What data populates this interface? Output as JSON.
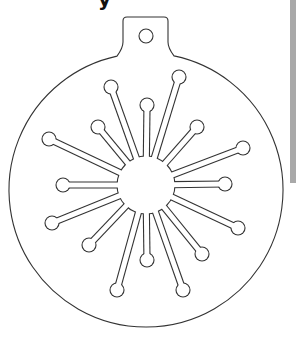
{
  "top_glyph": "y",
  "colors": {
    "line": "#333333",
    "background": "#ffffff",
    "side_strip": "#a9a9a9"
  },
  "ornament": {
    "outer_circle": {
      "cx": 146,
      "cy": 190,
      "r": 137
    },
    "hanger_tab": {
      "left": 123,
      "right": 168,
      "top": 17,
      "join_y": 46,
      "corner_r": 4
    },
    "hanger_hole": {
      "cx": 146,
      "cy": 36,
      "r": 7
    },
    "hub": {
      "cx": 146,
      "cy": 185,
      "r": 29
    },
    "stem_width": 5,
    "ball_r": 7,
    "spokes": [
      {
        "x": 111,
        "y": 87
      },
      {
        "x": 179,
        "y": 77
      },
      {
        "x": 147,
        "y": 105
      },
      {
        "x": 98,
        "y": 127
      },
      {
        "x": 197,
        "y": 127
      },
      {
        "x": 49,
        "y": 139
      },
      {
        "x": 243,
        "y": 148
      },
      {
        "x": 63,
        "y": 185
      },
      {
        "x": 225,
        "y": 184
      },
      {
        "x": 52,
        "y": 223
      },
      {
        "x": 238,
        "y": 228
      },
      {
        "x": 89,
        "y": 245
      },
      {
        "x": 202,
        "y": 254
      },
      {
        "x": 147,
        "y": 260
      },
      {
        "x": 117,
        "y": 290
      },
      {
        "x": 183,
        "y": 290
      }
    ]
  }
}
